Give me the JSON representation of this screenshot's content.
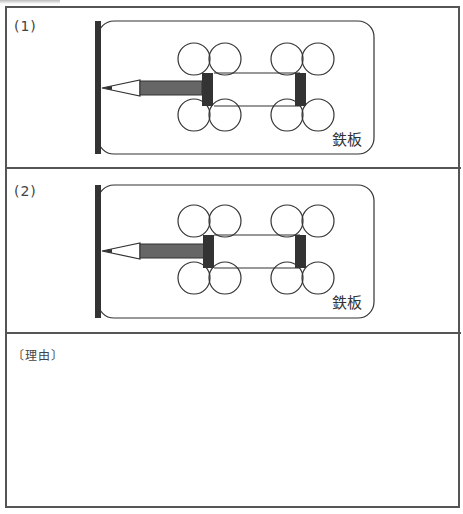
{
  "panels": [
    {
      "label": "(1)",
      "plate_label": "鉄板"
    },
    {
      "label": "(2)",
      "plate_label": "鉄板"
    }
  ],
  "reason": {
    "label": "〔理由〕",
    "answer": ""
  },
  "colors": {
    "border": "#555555",
    "bar": "#333333",
    "pencil_body": "#666666"
  }
}
